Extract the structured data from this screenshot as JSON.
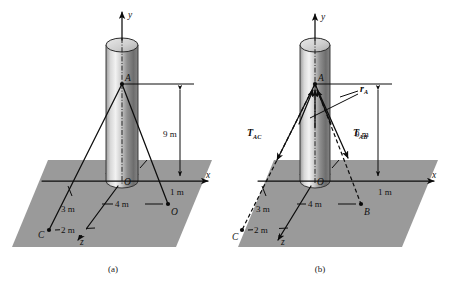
{
  "figure": {
    "background_color": "#ffffff",
    "ground_color": "#9a9a9a",
    "line_color": "#0c0c0c"
  },
  "panels": [
    {
      "id": "a",
      "caption": "(a)",
      "axes": [
        {
          "name": "y-axis",
          "label": "y"
        },
        {
          "name": "x-axis",
          "label": "x"
        },
        {
          "name": "z-axis",
          "label": "z"
        }
      ],
      "points": [
        {
          "name": "point-a",
          "label": "A"
        },
        {
          "name": "point-o",
          "label": "O"
        },
        {
          "name": "point-b",
          "label": "B"
        },
        {
          "name": "point-c",
          "label": "C"
        }
      ],
      "dimensions": [
        {
          "name": "height-dimension",
          "label": "9 m"
        },
        {
          "name": "b-offset-dimension",
          "label": "1 m"
        },
        {
          "name": "ob-dimension",
          "label": "4 m"
        },
        {
          "name": "c-depth-dimension",
          "label": "3 m"
        },
        {
          "name": "c-offset-dimension",
          "label": "2 m"
        }
      ]
    },
    {
      "id": "b",
      "caption": "(b)",
      "axes": [
        {
          "name": "y-axis",
          "label": "y"
        },
        {
          "name": "x-axis",
          "label": "x"
        },
        {
          "name": "z-axis",
          "label": "z"
        }
      ],
      "points": [
        {
          "name": "point-a",
          "label": "A"
        },
        {
          "name": "point-o",
          "label": "O"
        },
        {
          "name": "point-b",
          "label": "B"
        },
        {
          "name": "point-c",
          "label": "C"
        }
      ],
      "forces": [
        {
          "name": "tension-ac",
          "symbol": "T",
          "subscript": "AC"
        },
        {
          "name": "tension-ab",
          "symbol": "T",
          "subscript": "AB"
        }
      ],
      "vectors": [
        {
          "name": "position-vector-a",
          "symbol": "r",
          "subscript": "A"
        }
      ],
      "dimensions": [
        {
          "name": "height-dimension",
          "label": "9 m"
        },
        {
          "name": "b-offset-dimension",
          "label": "1 m"
        },
        {
          "name": "ob-dimension",
          "label": "4 m"
        },
        {
          "name": "c-depth-dimension",
          "label": "3 m"
        },
        {
          "name": "c-offset-dimension",
          "label": "2 m"
        }
      ]
    }
  ]
}
